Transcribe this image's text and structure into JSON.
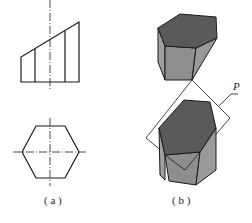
{
  "figure": {
    "panels": [
      {
        "id": "a",
        "label": "( a )",
        "description": "Orthographic views of a hexagonal prism: front view with inclined cut and top view hexagon"
      },
      {
        "id": "b",
        "label": "( b )",
        "description": "Isometric view of hexagonal prism cut by inclined plane P"
      }
    ],
    "plane_label": "P",
    "colors": {
      "line": "#1a1a1a",
      "dark_face": "#5a5a5a",
      "mid_face": "#8e8e8e",
      "light_face": "#a8a8a8",
      "background": "#ffffff"
    }
  }
}
